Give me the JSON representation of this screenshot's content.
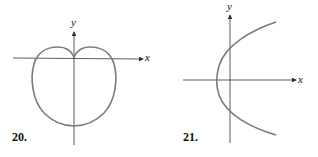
{
  "figures": [
    {
      "number": "20.",
      "x_label": "x",
      "y_label": "y",
      "curve": "cardioid-like closed curve with cusp at origin, opening downward"
    },
    {
      "number": "21.",
      "x_label": "x",
      "y_label": "y",
      "curve": "parabola opening to the right, vertex left of the y-axis"
    }
  ],
  "colors": {
    "curve": "#7a7a7a",
    "axis": "#333333"
  }
}
